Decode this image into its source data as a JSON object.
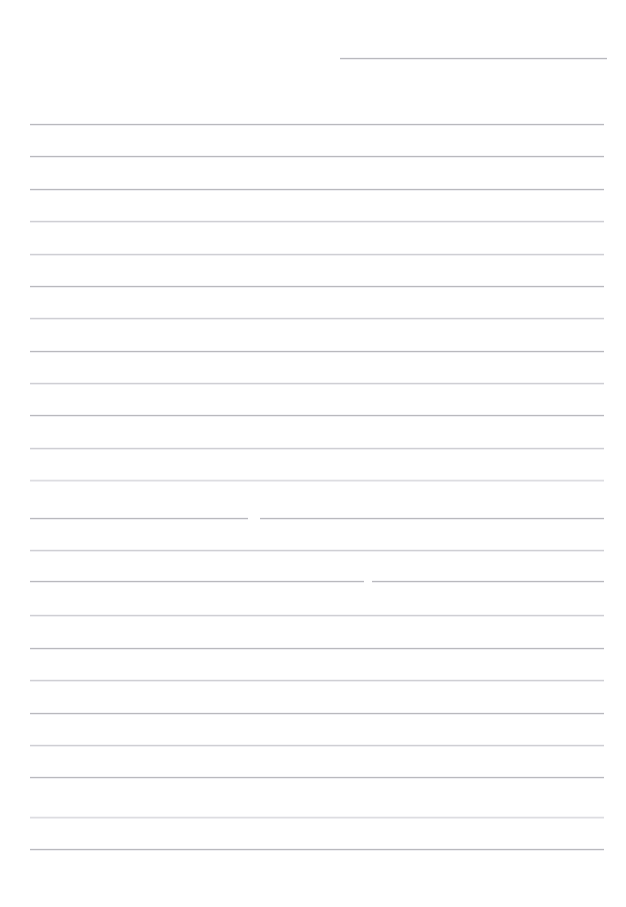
{
  "page": {
    "width": 626,
    "height": 907,
    "background_color": "#ffffff",
    "kind": "blank-ruled-page"
  },
  "top_strip": {
    "description": "row of cropped, nearly invisible glyph tops at the very top edge",
    "ghost_text": "                                                                                                        ",
    "color": "#fbfbfc"
  },
  "rules": {
    "left_x": 30,
    "right_x": 604,
    "default_color": "#b9b9be",
    "spacing": 32.3,
    "items": [
      {
        "y": 58,
        "x1": 340,
        "x2": 607,
        "tone": "default",
        "gap": null
      },
      {
        "y": 124,
        "x1": 30,
        "x2": 604,
        "tone": "default",
        "gap": null
      },
      {
        "y": 156,
        "x1": 30,
        "x2": 604,
        "tone": "default",
        "gap": null
      },
      {
        "y": 189,
        "x1": 30,
        "x2": 604,
        "tone": "default",
        "gap": null
      },
      {
        "y": 221,
        "x1": 30,
        "x2": 604,
        "tone": "light",
        "gap": null
      },
      {
        "y": 254,
        "x1": 30,
        "x2": 604,
        "tone": "light",
        "gap": null
      },
      {
        "y": 286,
        "x1": 30,
        "x2": 604,
        "tone": "default",
        "gap": null
      },
      {
        "y": 318,
        "x1": 30,
        "x2": 604,
        "tone": "light",
        "gap": null
      },
      {
        "y": 351,
        "x1": 30,
        "x2": 604,
        "tone": "default",
        "gap": null
      },
      {
        "y": 383,
        "x1": 30,
        "x2": 604,
        "tone": "light",
        "gap": null
      },
      {
        "y": 415,
        "x1": 30,
        "x2": 604,
        "tone": "default",
        "gap": null
      },
      {
        "y": 448,
        "x1": 30,
        "x2": 604,
        "tone": "light",
        "gap": null
      },
      {
        "y": 480,
        "x1": 30,
        "x2": 604,
        "tone": "faint",
        "gap": null
      },
      {
        "y": 518,
        "x1": 30,
        "x2": 604,
        "tone": "default",
        "gap": [
          248,
          260
        ]
      },
      {
        "y": 550,
        "x1": 30,
        "x2": 604,
        "tone": "light",
        "gap": null
      },
      {
        "y": 581,
        "x1": 30,
        "x2": 604,
        "tone": "default",
        "gap": [
          364,
          372
        ]
      },
      {
        "y": 615,
        "x1": 30,
        "x2": 604,
        "tone": "light",
        "gap": null
      },
      {
        "y": 648,
        "x1": 30,
        "x2": 604,
        "tone": "default",
        "gap": null
      },
      {
        "y": 680,
        "x1": 30,
        "x2": 604,
        "tone": "light",
        "gap": null
      },
      {
        "y": 713,
        "x1": 30,
        "x2": 604,
        "tone": "default",
        "gap": null
      },
      {
        "y": 745,
        "x1": 30,
        "x2": 604,
        "tone": "light",
        "gap": null
      },
      {
        "y": 777,
        "x1": 30,
        "x2": 604,
        "tone": "default",
        "gap": null
      },
      {
        "y": 817,
        "x1": 30,
        "x2": 604,
        "tone": "faint",
        "gap": null
      },
      {
        "y": 849,
        "x1": 30,
        "x2": 604,
        "tone": "default",
        "gap": null
      }
    ]
  }
}
